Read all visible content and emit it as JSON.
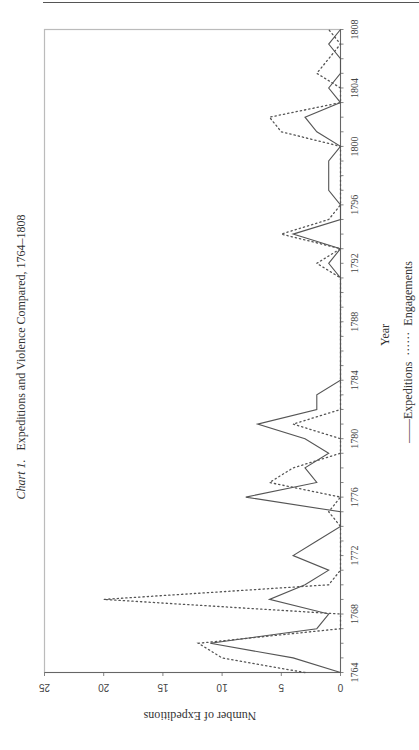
{
  "page": {
    "has_top_rule": true
  },
  "chart_data": {
    "type": "line",
    "title_prefix": "Chart 1.",
    "title": "Expeditions and Violence Compared, 1764–1808",
    "xlabel": "Year",
    "ylabel": "Number of Expeditions",
    "orientation": "rotated 90° counter-clockwise (years run bottom-to-top, values right-to-left)",
    "x": [
      1764,
      1765,
      1766,
      1767,
      1768,
      1769,
      1770,
      1771,
      1772,
      1773,
      1774,
      1775,
      1776,
      1777,
      1778,
      1779,
      1780,
      1781,
      1782,
      1783,
      1784,
      1785,
      1786,
      1787,
      1788,
      1789,
      1790,
      1791,
      1792,
      1793,
      1794,
      1795,
      1796,
      1797,
      1798,
      1799,
      1800,
      1801,
      1802,
      1803,
      1804,
      1805,
      1806,
      1807,
      1808
    ],
    "x_ticks": [
      1764,
      1768,
      1772,
      1776,
      1780,
      1784,
      1788,
      1792,
      1796,
      1800,
      1804,
      1808
    ],
    "y_ticks": [
      0,
      5,
      10,
      15,
      20,
      25
    ],
    "ylim": [
      0,
      25
    ],
    "xlim": [
      1764,
      1808
    ],
    "grid": false,
    "legend_position": "below x-axis title",
    "legend": [
      {
        "name": "Expeditions",
        "style": "solid",
        "glyph": "——"
      },
      {
        "name": "Engagements",
        "style": "dotted",
        "glyph": "······"
      }
    ],
    "series": [
      {
        "name": "Expeditions",
        "style": "solid",
        "color": "#555555",
        "values": [
          0,
          4,
          11,
          2,
          1,
          6,
          3,
          1,
          4,
          2,
          0,
          0,
          8,
          2,
          3,
          1,
          3,
          7,
          2,
          2,
          0,
          0,
          0,
          0,
          0,
          0,
          0,
          0,
          1,
          0,
          4,
          0,
          0,
          1,
          1,
          1,
          0,
          2,
          3,
          0,
          1,
          0,
          0,
          1,
          0
        ]
      },
      {
        "name": "Engagements",
        "style": "dotted",
        "color": "#555555",
        "values": [
          3,
          10,
          12,
          0,
          0,
          20,
          1,
          0,
          0,
          0,
          0,
          1,
          0,
          6,
          4,
          0,
          0,
          4,
          0,
          0,
          0,
          0,
          0,
          0,
          0,
          0,
          0,
          0,
          2,
          0,
          5,
          1,
          0,
          0,
          0,
          0,
          0,
          5,
          6,
          0,
          0,
          2,
          1,
          0,
          1
        ]
      }
    ]
  }
}
